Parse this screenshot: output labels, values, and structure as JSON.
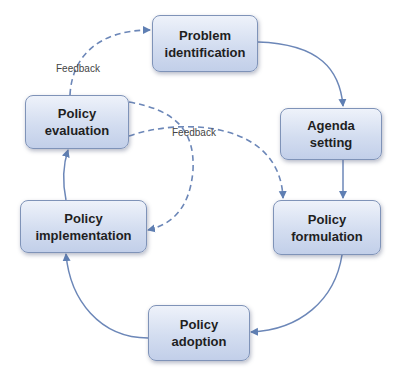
{
  "diagram": {
    "type": "policy-cycle",
    "colors": {
      "solid_arrow": "#5f7fb3",
      "dashed_arrow": "#5f7fb3",
      "box_border": "#7f93b8",
      "box_fill_top": "#eef2fa",
      "box_fill_bottom": "#c2cfe9"
    },
    "nodes": [
      {
        "id": "problem",
        "line1": "Problem",
        "line2": "identification"
      },
      {
        "id": "agenda",
        "line1": "Agenda",
        "line2": "setting"
      },
      {
        "id": "formulation",
        "line1": "Policy",
        "line2": "formulation"
      },
      {
        "id": "adoption",
        "line1": "Policy",
        "line2": "adoption"
      },
      {
        "id": "implementation",
        "line1": "Policy",
        "line2": "implementation"
      },
      {
        "id": "evaluation",
        "line1": "Policy",
        "line2": "evaluation"
      }
    ],
    "edges": [
      {
        "from": "problem",
        "to": "agenda",
        "style": "solid"
      },
      {
        "from": "agenda",
        "to": "formulation",
        "style": "solid"
      },
      {
        "from": "formulation",
        "to": "adoption",
        "style": "solid"
      },
      {
        "from": "adoption",
        "to": "implementation",
        "style": "solid"
      },
      {
        "from": "implementation",
        "to": "evaluation",
        "style": "solid"
      },
      {
        "from": "evaluation",
        "to": "problem",
        "style": "dashed",
        "label": "Feedback"
      },
      {
        "from": "evaluation",
        "to": "formulation",
        "style": "dashed",
        "label": "Feedback"
      },
      {
        "from": "evaluation",
        "to": "implementation",
        "style": "dashed"
      }
    ],
    "labels": {
      "feedback_top": "Feedback",
      "feedback_mid": "Feedback"
    }
  }
}
